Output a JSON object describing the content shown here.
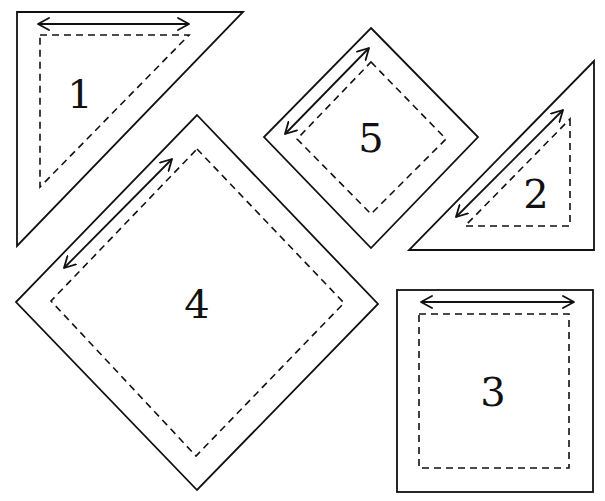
{
  "diagram": {
    "pieces": [
      {
        "id": "piece-1",
        "label": "1",
        "shape": "right-triangle"
      },
      {
        "id": "piece-2",
        "label": "2",
        "shape": "right-triangle"
      },
      {
        "id": "piece-3",
        "label": "3",
        "shape": "square"
      },
      {
        "id": "piece-4",
        "label": "4",
        "shape": "square-on-point"
      },
      {
        "id": "piece-5",
        "label": "5",
        "shape": "square-on-point"
      }
    ],
    "legend": {
      "solid_line": "cut line",
      "dashed_line": "seam line",
      "double_arrow": "grain direction"
    },
    "colors": {
      "stroke": "#111111",
      "background": "#ffffff"
    }
  }
}
